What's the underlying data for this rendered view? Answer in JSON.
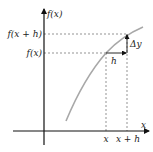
{
  "diagram": {
    "axes": {
      "y_label": "f(x)",
      "x_label": "x"
    },
    "y_ticks": [
      {
        "label": "f(x + h)"
      },
      {
        "label": "f(x)"
      }
    ],
    "x_ticks": [
      {
        "label": "x"
      },
      {
        "label": "x + h"
      }
    ],
    "annotations": {
      "horizontal_step": "h",
      "vertical_step": "Δy"
    },
    "colors": {
      "axis": "#111111",
      "curve": "#a8a8a8",
      "guide": "#555555",
      "arrow": "#111111"
    }
  }
}
